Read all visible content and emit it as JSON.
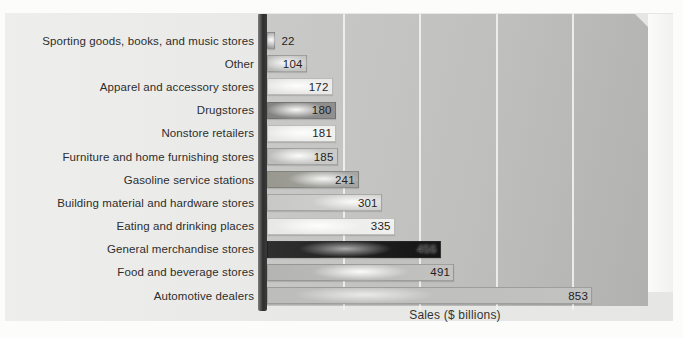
{
  "colors": {
    "panel": "#e8e9e7",
    "plot_from": "#cacbc9",
    "plot_to": "#b1b2b0",
    "wall_dark": "#2e2e2e",
    "gridline": "#f5f5f3",
    "text": "#2d2d2d"
  },
  "chart_data": {
    "type": "bar",
    "orientation": "horizontal",
    "title": "",
    "xlabel": "Sales ($ billions)",
    "ylabel": "",
    "xlim": [
      0,
      1000
    ],
    "grid": true,
    "gridlines_x": [
      200,
      400,
      600,
      800
    ],
    "value_labels_position": "inside-end",
    "legend": "none",
    "categories": [
      "Sporting goods, books, and music stores",
      "Other",
      "Apparel and accessory stores",
      "Drugstores",
      "Nonstore retailers",
      "Furniture and home furnishing stores",
      "Gasoline service stations",
      "Building material and hardware stores",
      "Eating and drinking places",
      "General merchandise stores",
      "Food and beverage stores",
      "Automotive dealers"
    ],
    "values": [
      22,
      104,
      172,
      180,
      181,
      185,
      241,
      301,
      335,
      456,
      491,
      853
    ],
    "bar_styles": [
      {
        "from": "#969696",
        "to": "#a8a8a8",
        "hl": 50,
        "hlc": "rgba(255,255,255,0.95)",
        "hlw": 16
      },
      {
        "from": "#b8b8b6",
        "to": "#c7c7c5",
        "hl": 45,
        "hlc": "rgba(255,255,255,0.9)",
        "hlw": 32
      },
      {
        "from": "#e2e2e0",
        "to": "#eceae9",
        "hl": 45,
        "hlc": "rgba(255,255,255,0.95)",
        "hlw": 50
      },
      {
        "from": "#828280",
        "to": "#909090",
        "hl": 42,
        "hlc": "rgba(255,255,255,0.95)",
        "hlw": 40
      },
      {
        "from": "#e7e7e5",
        "to": "#efefec",
        "hl": 50,
        "hlc": "rgba(255,255,255,0.95)",
        "hlw": 50
      },
      {
        "from": "#bcbcba",
        "to": "#cbcbc9",
        "hl": 44,
        "hlc": "rgba(255,255,255,0.95)",
        "hlw": 40
      },
      {
        "from": "#98988f",
        "to": "#a6a6a4",
        "hl": 62,
        "hlc": "rgba(255,255,255,0.9)",
        "hlw": 48
      },
      {
        "from": "#c8c8c6",
        "to": "#d2d2d0",
        "hl": 75,
        "hlc": "rgba(255,255,255,0.9)",
        "hlw": 55
      },
      {
        "from": "#e8e8e6",
        "to": "#f0f0ee",
        "hl": 40,
        "hlc": "rgba(255,255,255,0.95)",
        "hlw": 60
      },
      {
        "from": "#2f2f2f",
        "to": "#141414",
        "hl": 45,
        "hlc": "rgba(205,205,205,0.8)",
        "hlw": 62,
        "vc": "#3d3d3d",
        "vs": "0 0 3px rgba(185,185,185,0.95)"
      },
      {
        "from": "#b4b4b2",
        "to": "#c3c3c1",
        "hl": 50,
        "hlc": "rgba(255,255,255,0.95)",
        "hlw": 65
      },
      {
        "from": "#bdbdbb",
        "to": "#c2c2c0",
        "hl": 30,
        "hlc": "rgba(242,242,240,0.85)",
        "hlw": 95
      }
    ]
  }
}
